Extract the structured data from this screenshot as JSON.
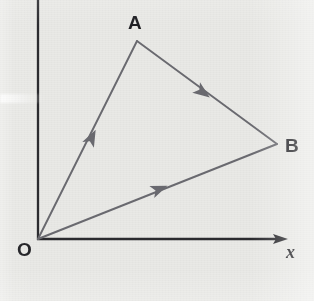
{
  "figure": {
    "kind": "vector-triangle-diagram",
    "background_color": "#e9e9e6",
    "axis_color": "#2a2a2e",
    "vector_color": "#6a6a70",
    "label_color": "#1f1f23"
  },
  "axes": {
    "origin": {
      "x": 38,
      "y": 239
    },
    "x_axis": {
      "label": "x",
      "from": {
        "x": 38,
        "y": 239
      },
      "to": {
        "x": 288,
        "y": 239
      },
      "has_arrowhead": true
    },
    "y_axis": {
      "label": "",
      "from": {
        "x": 38,
        "y": 239
      },
      "to": {
        "x": 38,
        "y": 0
      },
      "has_arrowhead": false
    }
  },
  "points": [
    {
      "name": "O",
      "label": "O",
      "x": 38,
      "y": 239
    },
    {
      "name": "A",
      "label": "A",
      "x": 137,
      "y": 41
    },
    {
      "name": "B",
      "label": "B",
      "x": 277,
      "y": 144
    }
  ],
  "vectors": [
    {
      "name": "OA",
      "from": "O",
      "to": "A",
      "arrow_at": {
        "x": 93,
        "y": 135
      }
    },
    {
      "name": "AB",
      "from": "A",
      "to": "B",
      "arrow_at": {
        "x": 205,
        "y": 94
      }
    },
    {
      "name": "OB",
      "from": "O",
      "to": "B",
      "arrow_at": {
        "x": 162,
        "y": 188
      }
    }
  ],
  "labels": {
    "a": "A",
    "b": "B",
    "o": "O",
    "x": "x"
  }
}
